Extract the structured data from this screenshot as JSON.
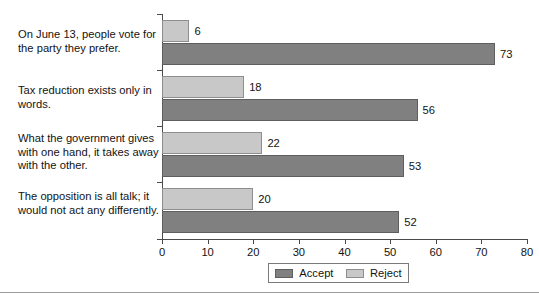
{
  "chart_data": {
    "type": "bar",
    "orientation": "horizontal",
    "title": "",
    "xlabel": "",
    "ylabel": "",
    "xlim": [
      0,
      80
    ],
    "xticks": [
      0,
      10,
      20,
      30,
      40,
      50,
      60,
      70,
      80
    ],
    "grid": false,
    "legend_position": "bottom-center",
    "categories": [
      "On June 13, people vote for the party they prefer.",
      "Tax reduction exists only in words.",
      "What the government gives with one hand, it takes away with the other.",
      "The opposition is all talk; it would not act any differently."
    ],
    "series": [
      {
        "name": "Accept",
        "color": "#808080",
        "values": [
          73,
          56,
          53,
          52
        ]
      },
      {
        "name": "Reject",
        "color": "#c8c8c8",
        "values": [
          6,
          18,
          22,
          20
        ]
      }
    ]
  },
  "axis": {
    "tick_labels": [
      "0",
      "10",
      "20",
      "30",
      "40",
      "50",
      "60",
      "70",
      "80"
    ]
  },
  "categories": [
    {
      "line1": "On June 13, people vote for",
      "line2": "the party they prefer.",
      "line3": ""
    },
    {
      "line1": "Tax reduction exists only in",
      "line2": "words.",
      "line3": ""
    },
    {
      "line1": "What the government gives",
      "line2": "with one hand, it takes away",
      "line3": "with the other."
    },
    {
      "line1": "The opposition is all talk; it",
      "line2": "would not act any differently.",
      "line3": ""
    }
  ],
  "values": {
    "accept": [
      "73",
      "56",
      "53",
      "52"
    ],
    "reject": [
      "6",
      "18",
      "22",
      "20"
    ]
  },
  "legend": {
    "accept_label": "Accept",
    "reject_label": "Reject"
  }
}
